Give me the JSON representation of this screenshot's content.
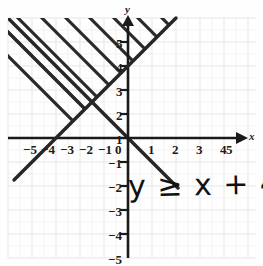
{
  "figure": {
    "title": "",
    "annotation_text": "y ≥ x + 4",
    "axis_label_x": "x",
    "axis_label_y": "y",
    "origin_label": "0"
  },
  "axes": {
    "x_tick_labels_negative": [
      "−5",
      "−4",
      "−3",
      "−2",
      "−1"
    ],
    "x_tick_labels_positive": [
      "1",
      "2",
      "3",
      "4",
      "5"
    ],
    "y_tick_labels_positive": [
      "1",
      "2",
      "3",
      "4",
      "5"
    ],
    "y_tick_labels_negative": [
      "−1",
      "−2",
      "−3",
      "−4",
      "−5"
    ]
  },
  "colors": {
    "grid": "#e8e8e8",
    "grid_minor": "#f2f2f2",
    "axis": "#1a1a1a",
    "line": "#262626",
    "hatch": "#262626",
    "background": "#fefefe",
    "text": "#1a1a1a"
  },
  "chart_data": {
    "type": "line",
    "title": "",
    "xlabel": "x",
    "ylabel": "y",
    "xlim": [
      -6,
      5.6
    ],
    "ylim": [
      -5.6,
      6
    ],
    "grid": true,
    "legend": "none",
    "x_ticks": [
      -5,
      -4,
      -3,
      -2,
      -1,
      0,
      1,
      2,
      3,
      4,
      5
    ],
    "y_ticks": [
      -5,
      -4,
      -3,
      -2,
      -1,
      0,
      1,
      2,
      3,
      4,
      5
    ],
    "annotations": [
      {
        "text": "y ≥ x + 4",
        "x": 0.2,
        "y": -3,
        "style": "handwritten"
      }
    ],
    "series": [
      {
        "name": "boundary line y = x + 4",
        "type": "line",
        "line_style": "solid",
        "slope": 1,
        "intercept": 4,
        "x_intercept": -4,
        "y_intercept": 4,
        "points": [
          [
            -6,
            -2
          ],
          [
            2,
            6
          ]
        ]
      }
    ],
    "shaded_region": {
      "inequality": "y >= x + 4",
      "boundary_included": true,
      "fill_style": "diagonal-hatch",
      "hatch_direction": "backslash",
      "side": "above-left"
    }
  }
}
